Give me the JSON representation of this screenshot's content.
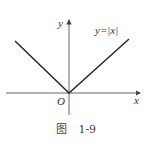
{
  "figure": {
    "function_label": "y=|x|",
    "x_axis_label": "x",
    "y_axis_label": "y",
    "origin_label": "O",
    "caption_prefix": "图",
    "caption_number": "1-9"
  },
  "colors": {
    "line": "#222222",
    "axis": "#555555"
  }
}
